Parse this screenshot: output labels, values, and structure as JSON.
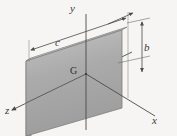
{
  "figure": {
    "kind": "engineering-mechanics-diagram",
    "background_color": "#f6f5f3",
    "line_color": "#4a4a4a",
    "axes": [
      {
        "name": "y-axis",
        "label": "y",
        "direction": "vertical-up"
      },
      {
        "name": "x-axis",
        "label": "x",
        "direction": "lower-right"
      },
      {
        "name": "z-axis",
        "label": "z",
        "direction": "lower-left"
      }
    ],
    "points": [
      {
        "name": "centroid",
        "label": "G",
        "description": "centroid of the plate at the origin of the axes"
      }
    ],
    "dimensions": [
      {
        "name": "height-dimension",
        "label": "b",
        "orientation": "vertical",
        "side": "right",
        "arrows": "both-ends"
      },
      {
        "name": "width-dimension",
        "label": "c",
        "orientation": "oblique",
        "side": "top-left",
        "arrows": "both-ends"
      }
    ],
    "body": {
      "name": "rectangular-plate",
      "shape": "thin rectangular plate",
      "face_color": "#ababab",
      "face_color_light": "#c2c2c2",
      "edge_color": "#8f8f8f",
      "thickness_face_color": "#9a9a9a"
    }
  }
}
